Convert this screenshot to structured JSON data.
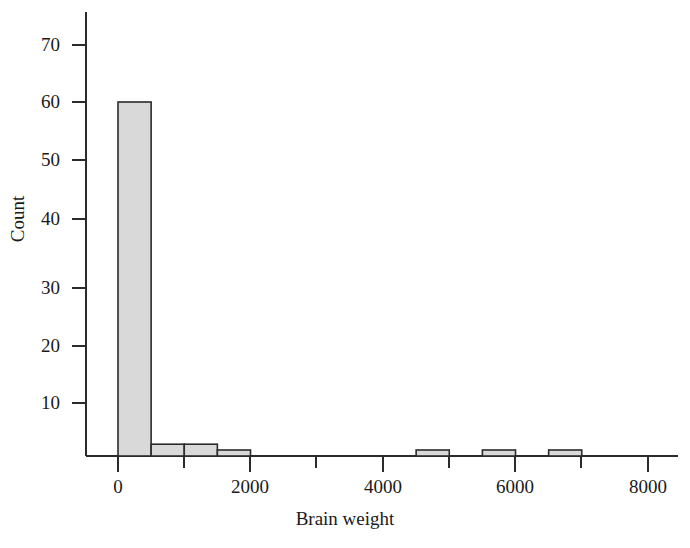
{
  "chart_data": {
    "type": "bar",
    "title": "",
    "subtitle": "",
    "xlabel": "Brain weight",
    "ylabel": "Count",
    "grid": false,
    "legend": null,
    "xlim": [
      -500,
      8500
    ],
    "ylim": [
      0,
      75
    ],
    "bin_width": 500,
    "xticks": [
      0,
      2000,
      4000,
      6000,
      8000
    ],
    "xticks_minor": [
      1000,
      3000,
      5000,
      7000
    ],
    "xtick_labels": [
      "0",
      "2000",
      "4000",
      "6000",
      "8000"
    ],
    "yticks": [
      10,
      20,
      30,
      40,
      50,
      60,
      70
    ],
    "ytick_labels": [
      "10",
      "20",
      "30",
      "40",
      "50",
      "60",
      "70"
    ],
    "bins": [
      {
        "x0": 0,
        "x1": 500,
        "count": 60
      },
      {
        "x0": 500,
        "x1": 1000,
        "count": 2
      },
      {
        "x0": 1000,
        "x1": 1500,
        "count": 2
      },
      {
        "x0": 1500,
        "x1": 2000,
        "count": 1
      },
      {
        "x0": 4500,
        "x1": 5000,
        "count": 1
      },
      {
        "x0": 5500,
        "x1": 6000,
        "count": 1
      },
      {
        "x0": 6500,
        "x1": 7000,
        "count": 1
      }
    ],
    "categories": [
      "0-500",
      "500-1000",
      "1000-1500",
      "1500-2000",
      "4500-5000",
      "5500-6000",
      "6500-7000"
    ],
    "values": [
      60,
      2,
      2,
      1,
      1,
      1,
      1
    ],
    "colors": {
      "bar_fill": "#d9d9d9",
      "bar_stroke": "#2b2b2b",
      "axis": "#2b2b2b",
      "text": "#1a1a1a",
      "background": "#ffffff"
    }
  },
  "labels": {
    "y_axis_title": "Count",
    "x_axis_title": "Brain weight",
    "ytick_70": "70",
    "ytick_60": "60",
    "ytick_50": "50",
    "ytick_40": "40",
    "ytick_30": "30",
    "ytick_20": "20",
    "ytick_10": "10",
    "xtick_0": "0",
    "xtick_2000": "2000",
    "xtick_4000": "4000",
    "xtick_6000": "6000",
    "xtick_8000": "8000"
  }
}
